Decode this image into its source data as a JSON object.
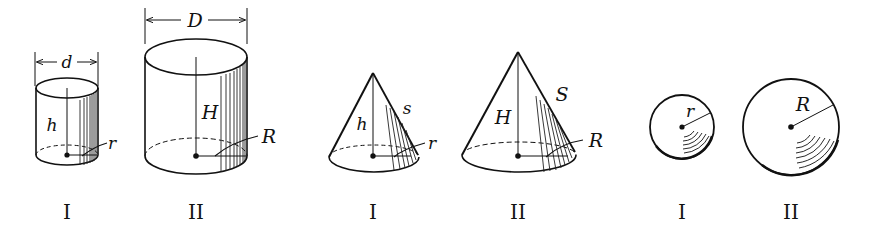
{
  "figure": {
    "groups": [
      {
        "shape": "cylinder",
        "figures": [
          {
            "roman": "I",
            "diameter_label": "d",
            "height_label": "h",
            "radius_label": "r"
          },
          {
            "roman": "II",
            "diameter_label": "D",
            "height_label": "H",
            "radius_label": "R"
          }
        ]
      },
      {
        "shape": "cone",
        "figures": [
          {
            "roman": "I",
            "height_label": "h",
            "slant_label": "s",
            "radius_label": "r"
          },
          {
            "roman": "II",
            "height_label": "H",
            "slant_label": "S",
            "radius_label": "R"
          }
        ]
      },
      {
        "shape": "sphere",
        "figures": [
          {
            "roman": "I",
            "radius_label": "r"
          },
          {
            "roman": "II",
            "radius_label": "R"
          }
        ]
      }
    ]
  },
  "colors": {
    "ink": "#111111",
    "background": "#ffffff"
  }
}
